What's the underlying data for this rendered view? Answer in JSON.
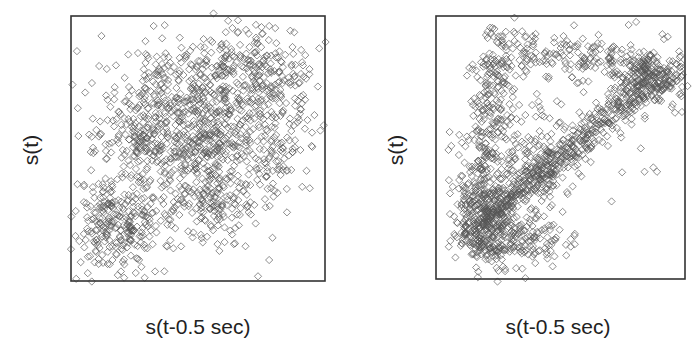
{
  "chart_data": [
    {
      "type": "scatter",
      "title": "",
      "xlabel": "s(t-0.5 sec)",
      "ylabel": "s(t)",
      "grid": false,
      "legend": null,
      "ticks": "none",
      "marker": "hollow-diamond",
      "marker_color": "#555555",
      "description": "Broad positive-correlation cloud; dense blobs along the diagonal (lower-left and center/upper-right), points spread widely",
      "frame_px": {
        "x": 71,
        "y": 16,
        "w": 254,
        "h": 265
      },
      "clusters": [
        {
          "cx": 0.18,
          "cy": 0.22,
          "sx": 0.09,
          "sy": 0.09,
          "n": 260
        },
        {
          "cx": 0.5,
          "cy": 0.55,
          "sx": 0.11,
          "sy": 0.1,
          "n": 300
        },
        {
          "cx": 0.72,
          "cy": 0.78,
          "sx": 0.11,
          "sy": 0.09,
          "n": 260
        },
        {
          "cx": 0.28,
          "cy": 0.55,
          "sx": 0.1,
          "sy": 0.1,
          "n": 160
        },
        {
          "cx": 0.55,
          "cy": 0.3,
          "sx": 0.1,
          "sy": 0.08,
          "n": 160
        },
        {
          "cx": 0.45,
          "cy": 0.75,
          "sx": 0.1,
          "sy": 0.07,
          "n": 120
        },
        {
          "cx": 0.8,
          "cy": 0.5,
          "sx": 0.08,
          "sy": 0.1,
          "n": 90
        },
        {
          "cx": 0.5,
          "cy": 0.5,
          "sx": 0.25,
          "sy": 0.25,
          "n": 180
        }
      ],
      "seed": 11
    },
    {
      "type": "scatter",
      "title": "",
      "xlabel": "s(t-0.5 sec)",
      "ylabel": "s(t)",
      "grid": false,
      "legend": null,
      "ticks": "none",
      "marker": "hollow-diamond",
      "marker_color": "#555555",
      "description": "Loop / triangle attractor: dense band from lower-left to upper-right, upper-left arm rising along left side, sparse top edge connecting back",
      "frame_px": {
        "x": 436,
        "y": 16,
        "w": 249,
        "h": 263
      },
      "paths": [
        {
          "from": [
            0.18,
            0.2
          ],
          "to": [
            0.9,
            0.78
          ],
          "spread": 0.035,
          "n": 520
        },
        {
          "from": [
            0.15,
            0.2
          ],
          "to": [
            0.25,
            0.85
          ],
          "spread": 0.05,
          "n": 300
        },
        {
          "from": [
            0.25,
            0.88
          ],
          "to": [
            0.9,
            0.8
          ],
          "spread": 0.05,
          "n": 220
        },
        {
          "from": [
            0.12,
            0.15
          ],
          "to": [
            0.45,
            0.15
          ],
          "spread": 0.05,
          "n": 220
        },
        {
          "from": [
            0.35,
            0.3
          ],
          "to": [
            0.4,
            0.55
          ],
          "spread": 0.06,
          "n": 120
        }
      ],
      "blobs": [
        {
          "cx": 0.18,
          "cy": 0.25,
          "sx": 0.06,
          "sy": 0.08,
          "n": 180
        },
        {
          "cx": 0.88,
          "cy": 0.76,
          "sx": 0.06,
          "sy": 0.05,
          "n": 140
        },
        {
          "cx": 0.5,
          "cy": 0.45,
          "sx": 0.25,
          "sy": 0.25,
          "n": 70
        }
      ],
      "seed": 29
    }
  ],
  "panels": [
    {
      "xlabel": "s(t-0.5 sec)",
      "ylabel": "s(t)"
    },
    {
      "xlabel": "s(t-0.5 sec)",
      "ylabel": "s(t)"
    }
  ]
}
